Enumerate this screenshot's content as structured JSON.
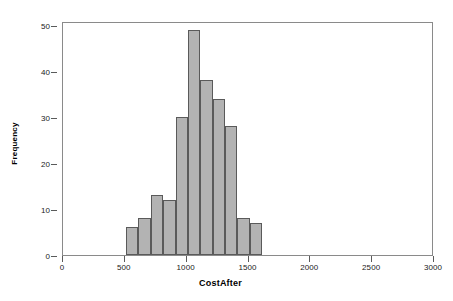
{
  "chart_data": {
    "type": "bar",
    "title": "",
    "subtitle": "",
    "xlabel": "CostAfter",
    "ylabel": "Frequency",
    "xlim": [
      0,
      3000
    ],
    "ylim": [
      0,
      50
    ],
    "grid": false,
    "legend": null,
    "bin_width": 100,
    "bin_starts": [
      510,
      610,
      710,
      810,
      910,
      1010,
      1110,
      1210,
      1310,
      1410,
      1510
    ],
    "bin_ends": [
      610,
      710,
      810,
      910,
      1010,
      1110,
      1210,
      1310,
      1410,
      1510,
      1610
    ],
    "categories": [
      "510-610",
      "610-710",
      "710-810",
      "810-910",
      "910-1010",
      "1010-1110",
      "1110-1210",
      "1210-1310",
      "1310-1410",
      "1410-1510",
      "1510-1610"
    ],
    "values": [
      6,
      8,
      13,
      12,
      30,
      49,
      38,
      34,
      28,
      8,
      7
    ],
    "xticks": [
      0,
      500,
      1000,
      1500,
      2000,
      2500,
      3000
    ],
    "xtick_labels": [
      "0",
      "500",
      "1000",
      "1500",
      "2000",
      "2500",
      "3000"
    ],
    "yticks": [
      0,
      10,
      20,
      30,
      40,
      50
    ],
    "ytick_labels": [
      "0",
      "10",
      "20",
      "30",
      "40",
      "50"
    ],
    "bar_fill_color": "#b3b3b3",
    "bar_border_color": "#5a5a5a",
    "frame_color": "#8a8a8a",
    "text_color": "#000000",
    "background_color": "#ffffff",
    "total_count": 233
  }
}
